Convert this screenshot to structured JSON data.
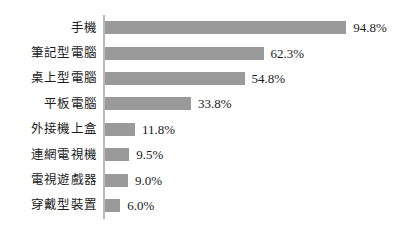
{
  "chart_data": {
    "type": "bar",
    "orientation": "horizontal",
    "title": "",
    "subtitle": "",
    "xlabel": "",
    "ylabel": "",
    "grid": false,
    "legend": false,
    "legend_position": "none",
    "axis_line": "vertical-left",
    "xlim": [
      0,
      100
    ],
    "unit": "%",
    "bar_color": "#9a9a9a",
    "text_color": "#1a1a1a",
    "background_color": "#ffffff",
    "categories": [
      "手機",
      "筆記型電腦",
      "桌上型電腦",
      "平板電腦",
      "外接機上盒",
      "連網電視機",
      "電視遊戲器",
      "穿戴型裝置"
    ],
    "values": [
      94.8,
      62.3,
      54.8,
      33.8,
      11.8,
      9.5,
      9.0,
      6.0
    ],
    "value_labels": [
      "94.8%",
      "62.3%",
      "54.8%",
      "33.8%",
      "11.8%",
      "9.5%",
      "9.0%",
      "6.0%"
    ],
    "rows": [
      {
        "label": "手機",
        "value": 94.8,
        "value_label": "94.8%"
      },
      {
        "label": "筆記型電腦",
        "value": 62.3,
        "value_label": "62.3%"
      },
      {
        "label": "桌上型電腦",
        "value": 54.8,
        "value_label": "54.8%"
      },
      {
        "label": "平板電腦",
        "value": 33.8,
        "value_label": "33.8%"
      },
      {
        "label": "外接機上盒",
        "value": 11.8,
        "value_label": "11.8%"
      },
      {
        "label": "連網電視機",
        "value": 9.5,
        "value_label": "9.5%"
      },
      {
        "label": "電視遊戲器",
        "value": 9.0,
        "value_label": "9.0%"
      },
      {
        "label": "穿戴型裝置",
        "value": 6.0,
        "value_label": "6.0%"
      }
    ]
  }
}
